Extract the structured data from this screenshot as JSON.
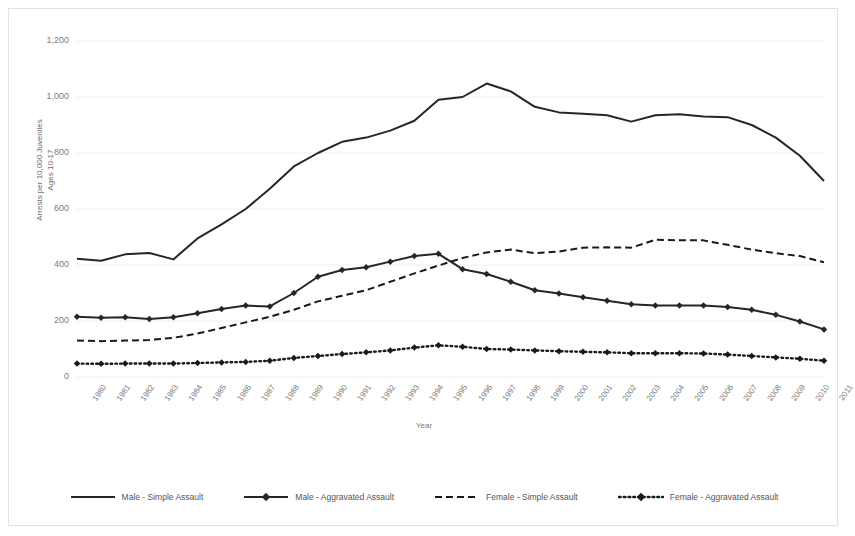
{
  "chart_data": {
    "type": "line",
    "title": "",
    "xlabel": "Year",
    "ylabel": "Arrests per 10,000 Juveniles Ages 10-17",
    "ylim": [
      0,
      1200
    ],
    "ytick_step": 200,
    "ytick_labels": [
      "1,200",
      "1,000",
      "800",
      "600",
      "400",
      "200",
      "0"
    ],
    "ytick_values": [
      1200,
      1000,
      800,
      600,
      400,
      200,
      0
    ],
    "grid": true,
    "legend_position": "bottom",
    "categories": [
      "1980",
      "1981",
      "1982",
      "1983",
      "1984",
      "1985",
      "1986",
      "1987",
      "1988",
      "1989",
      "1990",
      "1991",
      "1992",
      "1993",
      "1994",
      "1995",
      "1996",
      "1997",
      "1998",
      "1999",
      "2000",
      "2001",
      "2002",
      "2003",
      "2004",
      "2005",
      "2006",
      "2007",
      "2008",
      "2009",
      "2010",
      "2011"
    ],
    "series": [
      {
        "name": "Male - Simple Assault",
        "style": "solid",
        "markers": false,
        "color": "#262626",
        "values": [
          422,
          415,
          438,
          443,
          420,
          495,
          545,
          600,
          672,
          752,
          800,
          840,
          855,
          880,
          915,
          990,
          1000,
          1048,
          1020,
          965,
          945,
          940,
          935,
          912,
          935,
          938,
          930,
          928,
          900,
          855,
          790,
          700
        ]
      },
      {
        "name": "Male - Aggravated Assault",
        "style": "solid",
        "markers": true,
        "color": "#262626",
        "values": [
          215,
          212,
          213,
          207,
          213,
          228,
          243,
          255,
          252,
          300,
          358,
          382,
          392,
          412,
          432,
          440,
          385,
          368,
          340,
          310,
          298,
          285,
          272,
          260,
          255,
          255,
          255,
          250,
          240,
          222,
          198,
          170
        ]
      },
      {
        "name": "Female - Simple Assault",
        "style": "dashed",
        "markers": false,
        "color": "#1a1a1a",
        "values": [
          130,
          128,
          130,
          132,
          140,
          155,
          175,
          195,
          215,
          240,
          270,
          290,
          310,
          340,
          370,
          398,
          425,
          445,
          455,
          442,
          448,
          462,
          463,
          462,
          490,
          488,
          488,
          472,
          455,
          442,
          432,
          410
        ]
      },
      {
        "name": "Female - Aggravated Assault",
        "style": "dotted",
        "markers": true,
        "color": "#1a1a1a",
        "values": [
          48,
          47,
          48,
          48,
          48,
          50,
          52,
          54,
          58,
          68,
          75,
          82,
          88,
          95,
          105,
          113,
          108,
          100,
          98,
          95,
          92,
          90,
          88,
          85,
          85,
          85,
          84,
          80,
          75,
          70,
          65,
          58
        ]
      }
    ],
    "annotations": []
  },
  "axis": {
    "x_title": "Year",
    "y_title_line1": "Arrests per 10,000 Juveniles",
    "y_title_line2": "Ages 10-17"
  },
  "legend": {
    "items": [
      {
        "label": "Male - Simple Assault",
        "sample": "solid-line"
      },
      {
        "label": "Male - Aggravated Assault",
        "sample": "solid-line-markers"
      },
      {
        "label": "Female - Simple Assault",
        "sample": "dashed-line"
      },
      {
        "label": "Female - Aggravated Assault",
        "sample": "dotted-line-markers"
      }
    ]
  },
  "colors": {
    "frame_border": "#e2e2e2",
    "gridline": "#eeeeee",
    "text": "#7b7b7b",
    "series_dark": "#262626"
  }
}
